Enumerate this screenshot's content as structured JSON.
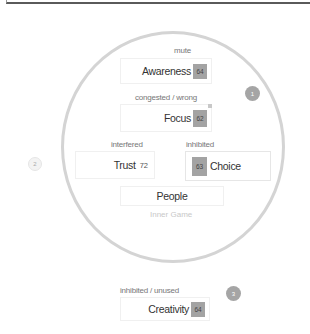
{
  "diagram": {
    "circle_title": "Inner Game",
    "center_label": "People",
    "nodes": {
      "awareness": {
        "status": "mute",
        "name": "Awareness",
        "score": "64"
      },
      "focus": {
        "status": "congested / wrong",
        "name": "Focus",
        "score": "62"
      },
      "trust": {
        "status": "interfered",
        "name": "Trust",
        "score": "72"
      },
      "choice": {
        "status": "inhibited",
        "name": "Choice",
        "score": "63"
      },
      "creativity": {
        "status": "inhibited / unused",
        "name": "Creativity",
        "score": "64"
      }
    },
    "badges": {
      "one": "1",
      "two": "2",
      "three": "3"
    }
  },
  "colors": {
    "score_bg": "#a3a3a3",
    "circle_border": "#d4d4d4",
    "badge_dark": "#a5a5a5"
  }
}
